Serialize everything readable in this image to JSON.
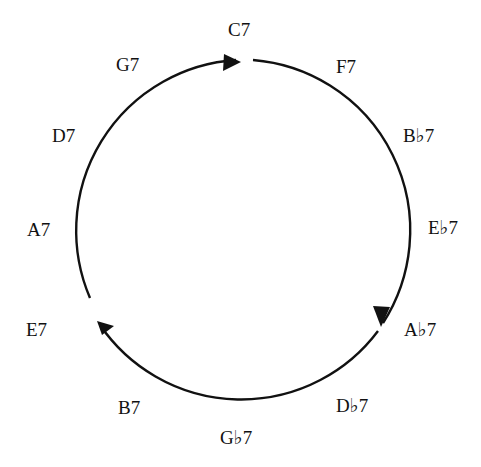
{
  "diagram": {
    "type": "cycle",
    "title": "",
    "direction": "clockwise",
    "colors": {
      "stroke": "#111111",
      "text": "#111111",
      "background": "#ffffff"
    },
    "nodes": [
      {
        "id": "c7",
        "label": "C7",
        "x": 228,
        "y": 20
      },
      {
        "id": "f7",
        "label": "F7",
        "x": 336,
        "y": 57
      },
      {
        "id": "bb7",
        "label": "B♭7",
        "x": 403,
        "y": 126
      },
      {
        "id": "eb7",
        "label": "E♭7",
        "x": 428,
        "y": 218
      },
      {
        "id": "ab7",
        "label": "A♭7",
        "x": 404,
        "y": 320
      },
      {
        "id": "db7",
        "label": "D♭7",
        "x": 336,
        "y": 396
      },
      {
        "id": "gb7",
        "label": "G♭7",
        "x": 220,
        "y": 428
      },
      {
        "id": "b7",
        "label": "B7",
        "x": 118,
        "y": 398
      },
      {
        "id": "e7",
        "label": "E7",
        "x": 26,
        "y": 320
      },
      {
        "id": "a7",
        "label": "A7",
        "x": 27,
        "y": 220
      },
      {
        "id": "d7",
        "label": "D7",
        "x": 52,
        "y": 126
      },
      {
        "id": "g7",
        "label": "G7",
        "x": 116,
        "y": 55
      }
    ],
    "arrows": [
      {
        "name": "arrow-to-c7",
        "points": "224,54 241,62 223,71"
      },
      {
        "name": "arrow-to-ab7",
        "points": "373,306 381,327 390,307"
      },
      {
        "name": "arrow-to-e7",
        "points": "97,321 114,326 102,335"
      }
    ],
    "arcs": [
      {
        "name": "arc-e7-to-c7",
        "d": "M 90 298 A 171 171 0 0 1 236 60"
      },
      {
        "name": "arc-c7-to-ab7",
        "d": "M 253 60 A 171 171 0 0 1 383 323"
      },
      {
        "name": "arc-ab7-to-e7",
        "d": "M 378 331 A 171 171 0 0 1 100 325"
      }
    ]
  }
}
